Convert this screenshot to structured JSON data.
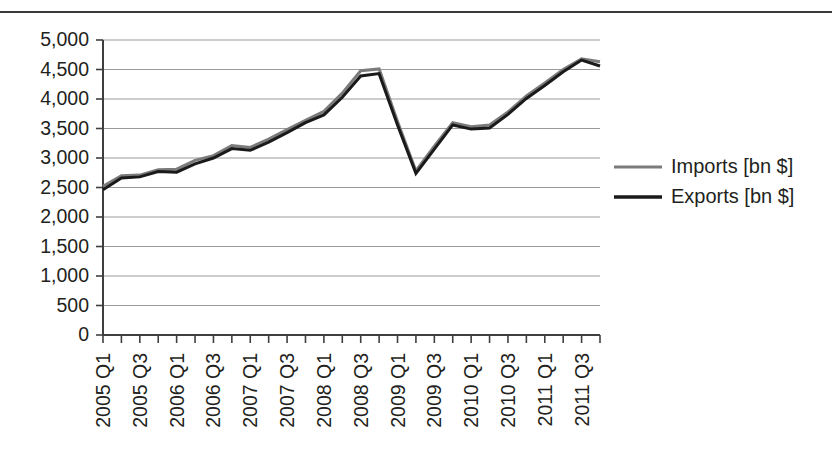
{
  "figure": {
    "background_color": "#ffffff",
    "has_top_rule": true,
    "plot": {
      "axis_color": "#3f3f3f",
      "grid_color": "#9a9a9a",
      "grid_visible": true,
      "left": 103,
      "right": 600,
      "top": 26,
      "bottom": 321
    }
  },
  "chart_data": {
    "type": "line",
    "title": "",
    "xlabel": "",
    "ylabel": "",
    "ylim": [
      0,
      5000
    ],
    "ytick_step": 500,
    "grid": true,
    "legend_position": "right",
    "y_ticks": [
      "0",
      "500",
      "1,000",
      "1,500",
      "2,000",
      "2,500",
      "3,000",
      "3,500",
      "4,000",
      "4,500",
      "5,000"
    ],
    "y_tick_values": [
      0,
      500,
      1000,
      1500,
      2000,
      2500,
      3000,
      3500,
      4000,
      4500,
      5000
    ],
    "categories": [
      "2005 Q1",
      "2005 Q2",
      "2005 Q3",
      "2005 Q4",
      "2006 Q1",
      "2006 Q2",
      "2006 Q3",
      "2006 Q4",
      "2007 Q1",
      "2007 Q2",
      "2007 Q3",
      "2007 Q4",
      "2008 Q1",
      "2008 Q2",
      "2008 Q3",
      "2008 Q4",
      "2009 Q1",
      "2009 Q2",
      "2009 Q3",
      "2009 Q4",
      "2010 Q1",
      "2010 Q2",
      "2010 Q3",
      "2010 Q4",
      "2011 Q1",
      "2011 Q2",
      "2011 Q3",
      "2011 Q4"
    ],
    "x_tick_labels_shown": [
      "2005 Q1",
      "2005 Q3",
      "2006 Q1",
      "2006 Q3",
      "2007 Q1",
      "2007 Q3",
      "2008 Q1",
      "2008 Q3",
      "2009 Q1",
      "2009 Q3",
      "2010 Q1",
      "2010 Q3",
      "2011 Q1",
      "2011 Q3"
    ],
    "x_tick_label_rotation": -90,
    "series": [
      {
        "name": "Imports [bn $]",
        "color": "#7b7b7b",
        "line_width": 3,
        "values": [
          2520,
          2700,
          2710,
          2800,
          2810,
          2960,
          3040,
          3210,
          3180,
          3320,
          3480,
          3640,
          3790,
          4100,
          4480,
          4510,
          3620,
          2780,
          3200,
          3600,
          3530,
          3560,
          3780,
          4050,
          4270,
          4500,
          4680,
          4630
        ]
      },
      {
        "name": "Exports [bn $]",
        "color": "#1a1a1a",
        "line_width": 3,
        "values": [
          2460,
          2660,
          2680,
          2770,
          2760,
          2900,
          3000,
          3160,
          3130,
          3270,
          3430,
          3600,
          3730,
          4030,
          4390,
          4430,
          3560,
          2740,
          3150,
          3560,
          3490,
          3510,
          3740,
          4010,
          4230,
          4460,
          4660,
          4560
        ]
      }
    ]
  },
  "legend": {
    "entries": [
      {
        "label": "Imports [bn $]",
        "color": "#7b7b7b"
      },
      {
        "label": "Exports [bn $]",
        "color": "#1a1a1a"
      }
    ]
  }
}
